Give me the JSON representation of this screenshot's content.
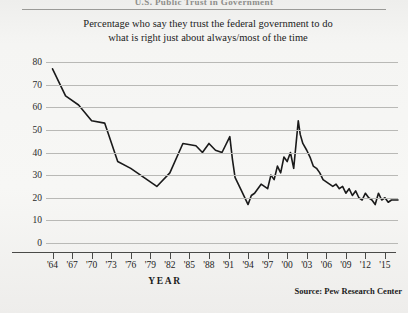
{
  "page": {
    "cut_off_header_text": "U.S. Public Trust in Government",
    "source_note": "Source:  Pew Research Center",
    "background_color": "#f4f4f2"
  },
  "chart_data": {
    "type": "line",
    "title": "Percentage who say they trust the federal government to do what is right just about always/most of the time",
    "title_lines": [
      "Percentage who say they trust the federal government to do",
      "what is right just about always/most of the time"
    ],
    "xlabel": "YEAR",
    "ylabel": "",
    "xlim": [
      1963,
      2017
    ],
    "ylim": [
      0,
      80
    ],
    "grid": true,
    "legend": false,
    "line_color": "#1a1a1a",
    "grid_color": "#b9b9b6",
    "ytick_labels": [
      "80",
      "70",
      "60",
      "50",
      "40",
      "30",
      "20",
      "10",
      "0"
    ],
    "ytick_values": [
      80,
      70,
      60,
      50,
      40,
      30,
      20,
      10,
      0
    ],
    "xtick_labels": [
      "'64",
      "'67",
      "'70",
      "'73",
      "'76",
      "'79",
      "'82",
      "'85",
      "'88",
      "'91",
      "'94",
      "'97",
      "'00",
      "'03",
      "'06",
      "'09",
      "'12",
      "'15"
    ],
    "xtick_values": [
      1964,
      1967,
      1970,
      1973,
      1976,
      1979,
      1982,
      1985,
      1988,
      1991,
      1994,
      1997,
      2000,
      2003,
      2006,
      2009,
      2012,
      2015
    ],
    "x": [
      1964,
      1966,
      1968,
      1970,
      1972,
      1974,
      1976,
      1978,
      1980,
      1982,
      1984,
      1986,
      1987,
      1988,
      1989,
      1990,
      1991.2,
      1991.6,
      1992,
      1993,
      1994,
      1994.5,
      1995,
      1996,
      1997,
      1997.5,
      1998,
      1998.5,
      1999,
      1999.5,
      2000,
      2000.5,
      2001,
      2001.7,
      2002,
      2002.4,
      2003,
      2003.5,
      2004,
      2004.5,
      2005,
      2005.5,
      2006,
      2006.5,
      2007,
      2007.5,
      2008,
      2008.5,
      2009,
      2009.5,
      2010,
      2010.5,
      2011,
      2011.5,
      2012,
      2012.5,
      2013,
      2013.5,
      2014,
      2014.5,
      2015,
      2015.5,
      2016,
      2016.5,
      2017
    ],
    "values": [
      77,
      65,
      61,
      54,
      53,
      36,
      33,
      29,
      25,
      31,
      44,
      43,
      40,
      44,
      41,
      40,
      47,
      37,
      29,
      23,
      17,
      21,
      22,
      26,
      24,
      30,
      28,
      34,
      31,
      38,
      36,
      40,
      33,
      54,
      48,
      44,
      41,
      38,
      34,
      33,
      31,
      28,
      27,
      26,
      25,
      26,
      24,
      25,
      22,
      24,
      21,
      23,
      20,
      19,
      22,
      20,
      19,
      17,
      22,
      19,
      20,
      18,
      19,
      19,
      19
    ]
  }
}
